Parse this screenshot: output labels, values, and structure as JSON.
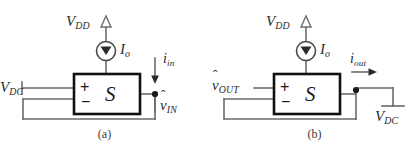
{
  "figure": {
    "background_color": "#ffffff",
    "line_color": "#6b6b6b",
    "box_color": "#1a1a1a",
    "text_color": "#2b2b2b"
  },
  "panels": [
    {
      "id": "a",
      "caption": "(a)",
      "supply_label": "V",
      "supply_sub": "DD",
      "supply_arrow_icon": "up-arrow-open-icon",
      "source_symbol_icon": "current-source-icon",
      "source_label": "I",
      "source_sub": "o",
      "box_letter": "S",
      "plus_sign": "+",
      "minus_sign": "−",
      "left_terminal_label": "V",
      "left_terminal_sub": "DC",
      "current_label": "i",
      "current_sub": "in",
      "current_arrow_icon": "down-arrow-icon",
      "node_label_hat": "ˆ",
      "node_label": "v",
      "node_sub": "IN",
      "node_dot_icon": "junction-dot-icon"
    },
    {
      "id": "b",
      "caption": "(b)",
      "supply_label": "V",
      "supply_sub": "DD",
      "supply_arrow_icon": "up-arrow-open-icon",
      "source_symbol_icon": "current-source-icon",
      "source_label": "I",
      "source_sub": "o",
      "box_letter": "S",
      "plus_sign": "+",
      "minus_sign": "−",
      "left_terminal_label_hat": "ˆ",
      "left_terminal_label": "v",
      "left_terminal_sub": "OUT",
      "current_label": "i",
      "current_sub": "out",
      "current_arrow_icon": "right-arrow-icon",
      "ground_label": "V",
      "ground_sub": "DC",
      "ground_symbol_icon": "ground-terminal-icon",
      "node_dot_icon": "junction-dot-icon"
    }
  ]
}
